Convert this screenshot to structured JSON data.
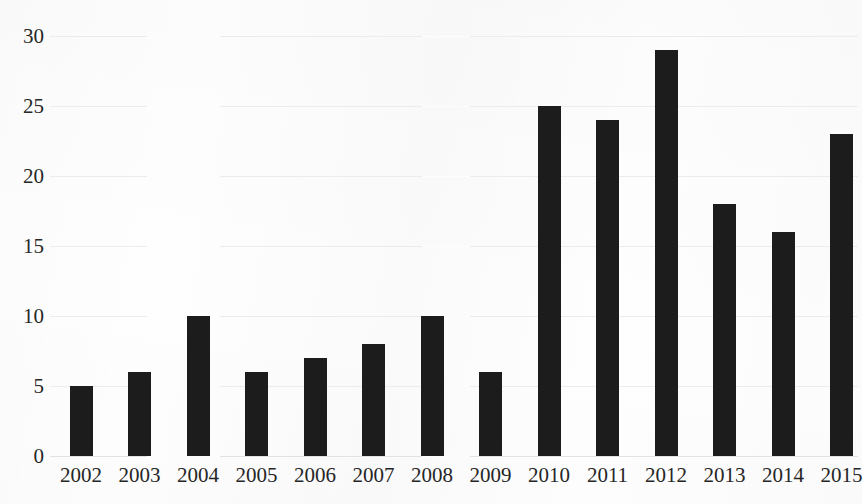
{
  "chart_data": {
    "type": "bar",
    "title": "",
    "subtitle": "",
    "xlabel": "",
    "ylabel": "",
    "categories": [
      "2002",
      "2003",
      "2004",
      "2005",
      "2006",
      "2007",
      "2008",
      "2009",
      "2010",
      "2011",
      "2012",
      "2013",
      "2014",
      "2015"
    ],
    "values": [
      5,
      6,
      10,
      6,
      7,
      8,
      10,
      6,
      25,
      24,
      29,
      18,
      16,
      23
    ],
    "ylim": [
      0,
      30
    ],
    "ytick_labels": [
      "0",
      "5",
      "10",
      "15",
      "20",
      "25",
      "30"
    ],
    "ytick_values": [
      0,
      5,
      10,
      15,
      20,
      25,
      30
    ],
    "grid": true,
    "grid_axis": "y",
    "legend": false,
    "legend_position": "none",
    "bar_color": "#1c1c1c",
    "grid_color": "#ececec",
    "background_color": "#fefefe",
    "text_color": "#262626"
  }
}
